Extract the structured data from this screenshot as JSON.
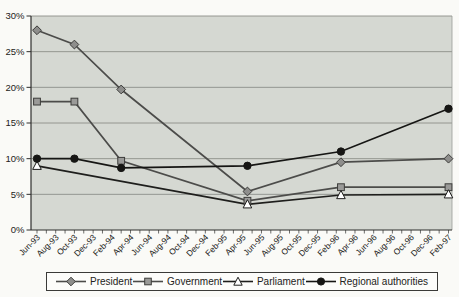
{
  "chart_data": {
    "type": "line",
    "title": "",
    "xlabel": "",
    "ylabel": "",
    "ylim": [
      0,
      30
    ],
    "month_span": 44,
    "grid": true,
    "legend_position": "bottom",
    "y_tick_labels": [
      "30%",
      "25%",
      "20%",
      "15%",
      "10%",
      "5%",
      "0%"
    ],
    "x_tick_labels": [
      "Jun-93",
      "Aug-93",
      "Oct-93",
      "Dec-93",
      "Feb-94",
      "Apr-94",
      "Jun-94",
      "Aug-94",
      "Oct-94",
      "Dec-94",
      "Feb-95",
      "Apr-95",
      "Jun-95",
      "Aug-95",
      "Oct-95",
      "Dec-95",
      "Feb-96",
      "Apr-96",
      "Jun-96",
      "Aug-96",
      "Oct-96",
      "Dec-96",
      "Feb-97"
    ],
    "series": [
      {
        "name": "President",
        "marker": "diamond",
        "line_color": "#4c4c4a",
        "marker_fill": "#8e8e8c",
        "marker_stroke": "#3c3c3a",
        "x_months": [
          0,
          4,
          9,
          22.5,
          32.5,
          44
        ],
        "values": [
          28,
          26,
          19.7,
          5.4,
          9.5,
          10
        ]
      },
      {
        "name": "Government",
        "marker": "square",
        "line_color": "#4c4c4a",
        "marker_fill": "#9a9a98",
        "marker_stroke": "#3c3c3a",
        "x_months": [
          0,
          4,
          9,
          22.5,
          32.5,
          44
        ],
        "values": [
          18,
          18,
          9.7,
          4.1,
          6,
          6
        ]
      },
      {
        "name": "Parliament",
        "marker": "triangle-up",
        "line_color": "#1e1e1c",
        "marker_fill": "#ffffff",
        "marker_stroke": "#1e1e1c",
        "x_months": [
          0,
          22.5,
          32.5,
          44
        ],
        "values": [
          9,
          3.6,
          4.9,
          5
        ]
      },
      {
        "name": "Regional authorities",
        "marker": "circle",
        "line_color": "#161614",
        "marker_fill": "#161614",
        "marker_stroke": "#161614",
        "x_months": [
          0,
          4,
          9,
          22.5,
          32.5,
          44
        ],
        "values": [
          10,
          10,
          8.7,
          9,
          11,
          17
        ]
      }
    ]
  },
  "colors": {
    "page_bg": "#fafaf7",
    "plot_bg": "#d5d8d2",
    "gridline": "#8c8f89",
    "plot_edge": "#9a9d97",
    "axis": "#2e2e2c",
    "text": "#222220",
    "legend_border": "#3a3a38",
    "legend_bg": "#fcfcfa"
  }
}
